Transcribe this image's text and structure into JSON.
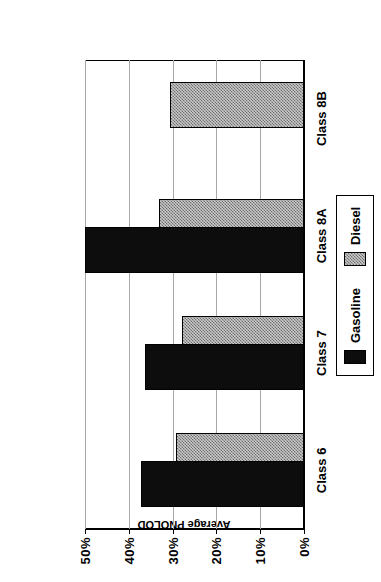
{
  "chart_data": {
    "type": "bar",
    "orientation": "horizontal",
    "title": "",
    "xlabel": "GVW Class",
    "ylabel": "Average PNOLOD",
    "categories": [
      "Class 6",
      "Class 7",
      "Class 8A",
      "Class 8B"
    ],
    "series": [
      {
        "name": "Gasoline",
        "color": "#0d0d0d",
        "values": [
          37.3,
          36.4,
          50.0,
          null
        ]
      },
      {
        "name": "Diesel",
        "color": "#c9c9c9",
        "values": [
          29.3,
          27.8,
          33.2,
          30.7
        ]
      }
    ],
    "ylim": [
      0,
      50
    ],
    "yticks": [
      50,
      40,
      30,
      20,
      10,
      0
    ],
    "ytick_labels": [
      "50%",
      "40%",
      "30%",
      "20%",
      "10%",
      "0%"
    ],
    "axis_inverted": true,
    "grid": true,
    "legend_position": "right",
    "legend_entries": [
      "Gasoline",
      "Diesel"
    ],
    "value_suffix": "%"
  },
  "axes": {
    "value_axis_title": "Average PNOLOD",
    "category_axis_title": "GVW Class"
  },
  "legend": {
    "gasoline_label": "Gasoline",
    "diesel_label": "Diesel"
  }
}
